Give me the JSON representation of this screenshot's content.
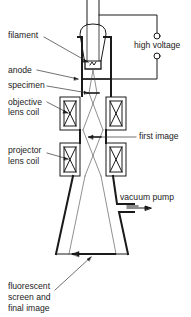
{
  "diagram": {
    "labels": {
      "filament": "filament",
      "high_voltage": "high voltage",
      "anode": "anode",
      "specimen": "specimen",
      "objective_line1": "objective",
      "objective_line2": "lens coil",
      "first_image": "first image",
      "projector_line1": "projector",
      "projector_line2": "lens coil",
      "vacuum_pump": "vacuum pump",
      "screen_line1": "fluorescent",
      "screen_line2": "screen and",
      "screen_line3": "final image"
    },
    "colors": {
      "line": "#1a1a1a",
      "background": "#ffffff"
    }
  }
}
